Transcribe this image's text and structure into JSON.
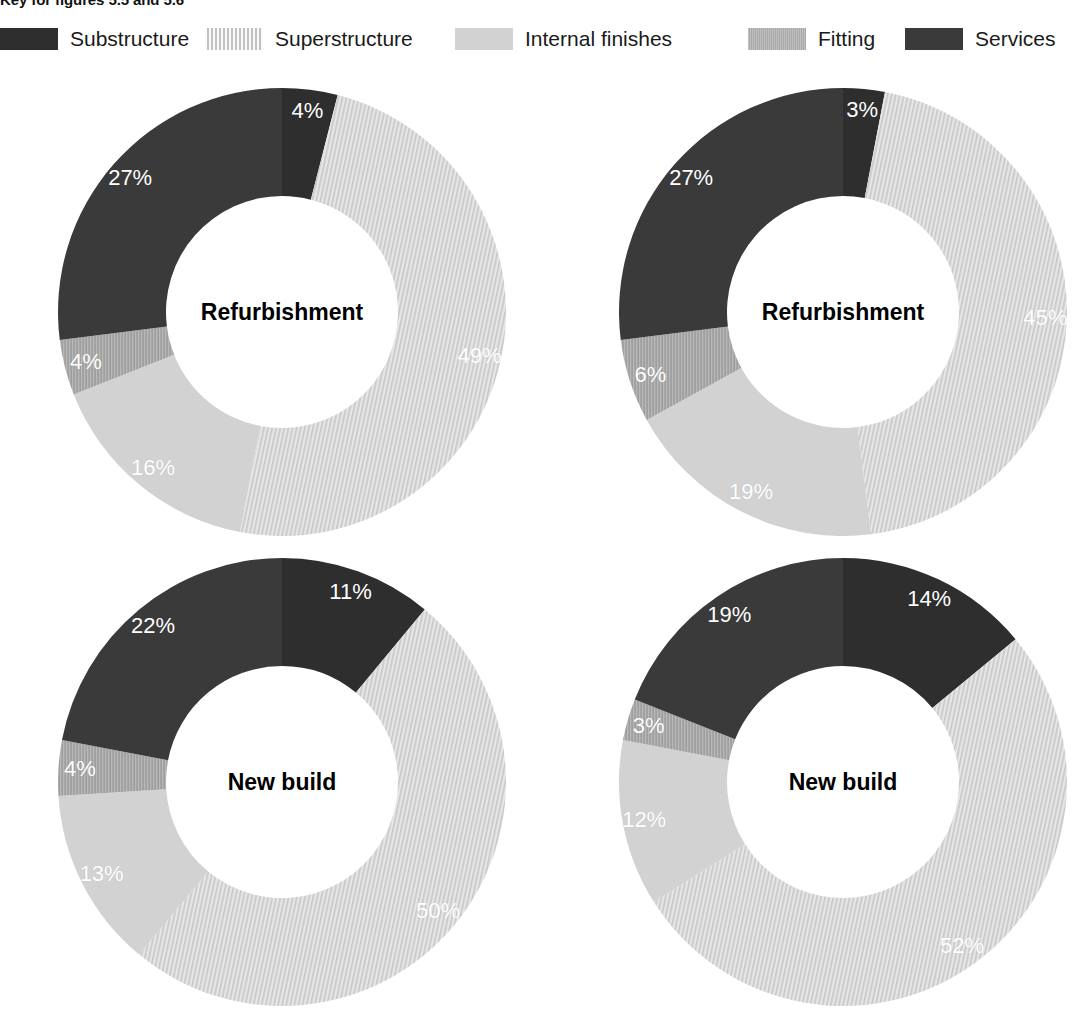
{
  "caption": "Key for figures 5.5 and 5.6",
  "legend": {
    "items": [
      {
        "label": "Substructure",
        "swatch": "solid-dark-swatch",
        "color": "#2e2e2e",
        "x": 0
      },
      {
        "label": "Superstructure",
        "swatch": "hatched-light-swatch",
        "color": "#dcdcdc",
        "x": 205
      },
      {
        "label": "Internal finishes",
        "swatch": "solid-light-gray-swatch",
        "color": "#d2d2d2",
        "x": 455
      },
      {
        "label": "Fitting",
        "swatch": "textured-mid-gray-swatch",
        "color": "#a8a8a8",
        "x": 748
      },
      {
        "label": "Services",
        "swatch": "solid-dark-gray-swatch",
        "color": "#3a3a3a",
        "x": 905
      }
    ]
  },
  "chart_data": [
    {
      "type": "pie",
      "id": "top-left",
      "title": "Refurbishment",
      "labels": [
        "Substructure",
        "Superstructure",
        "Internal finishes",
        "Fitting",
        "Services"
      ],
      "values": [
        4,
        49,
        16,
        4,
        27
      ],
      "value_labels": [
        "4%",
        "49%",
        "16%",
        "4%",
        "27%"
      ],
      "unit": "%"
    },
    {
      "type": "pie",
      "id": "top-right",
      "title": "Refurbishment",
      "labels": [
        "Substructure",
        "Superstructure",
        "Internal finishes",
        "Fitting",
        "Services"
      ],
      "values": [
        3,
        45,
        19,
        6,
        27
      ],
      "value_labels": [
        "3%",
        "45%",
        "19%",
        "6%",
        "27%"
      ],
      "unit": "%"
    },
    {
      "type": "pie",
      "id": "bottom-left",
      "title": "New build",
      "labels": [
        "Substructure",
        "Superstructure",
        "Internal finishes",
        "Fitting",
        "Services"
      ],
      "values": [
        11,
        50,
        13,
        4,
        22
      ],
      "value_labels": [
        "11%",
        "50%",
        "13%",
        "4%",
        "22%"
      ],
      "unit": "%"
    },
    {
      "type": "pie",
      "id": "bottom-right",
      "title": "New build",
      "labels": [
        "Substructure",
        "Superstructure",
        "Internal finishes",
        "Fitting",
        "Services"
      ],
      "values": [
        14,
        52,
        12,
        3,
        19
      ],
      "value_labels": [
        "14%",
        "52%",
        "12%",
        "3%",
        "19%"
      ],
      "unit": "%"
    }
  ],
  "charts_layout": [
    {
      "cx": 282,
      "cy": 312,
      "r": 224,
      "inner": 116
    },
    {
      "cx": 843,
      "cy": 312,
      "r": 224,
      "inner": 116
    },
    {
      "cx": 282,
      "cy": 782,
      "r": 224,
      "inner": 116
    },
    {
      "cx": 843,
      "cy": 782,
      "r": 224,
      "inner": 116
    }
  ]
}
